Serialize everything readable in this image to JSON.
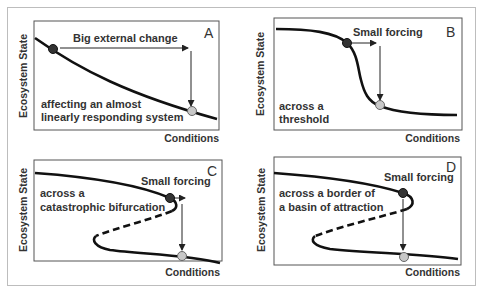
{
  "figure": {
    "colors": {
      "curve": "#111111",
      "box": "#555555",
      "frame": "#bdbdbd",
      "text": "#333333",
      "dot_initial": "#333333",
      "dot_final": "#c8c8c8"
    },
    "panels": [
      {
        "letter": "A",
        "y_axis_label": "Ecosystem State",
        "x_axis_label": "Conditions",
        "forcing_label": "Big external change",
        "description_line1": "affecting an almost",
        "description_line2": "linearly responding system"
      },
      {
        "letter": "B",
        "y_axis_label": "Ecosystem State",
        "x_axis_label": "Conditions",
        "forcing_label": "Small forcing",
        "description_line1": "across a",
        "description_line2": "threshold"
      },
      {
        "letter": "C",
        "y_axis_label": "Ecosystem State",
        "x_axis_label": "Conditions",
        "forcing_label": "Small forcing",
        "description_line1": "across a",
        "description_line2": "catastrophic bifurcation"
      },
      {
        "letter": "D",
        "y_axis_label": "Ecosystem State",
        "x_axis_label": "Conditions",
        "forcing_label": "Small forcing",
        "description_line1": "across a border of",
        "description_line2": "a basin of attraction"
      }
    ]
  }
}
